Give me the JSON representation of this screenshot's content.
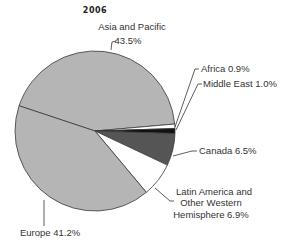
{
  "chart_data": {
    "type": "pie",
    "title": "2006",
    "categories": [
      "Asia and Pacific",
      "Africa",
      "Middle East",
      "Canada",
      "Latin America and Other Western Hemisphere",
      "Europe"
    ],
    "values": [
      43.5,
      0.9,
      1.0,
      6.5,
      6.9,
      41.2
    ],
    "unit": "%",
    "colors": [
      "#b5b5b5",
      "#ffffff",
      "#111111",
      "#555555",
      "#ffffff",
      "#b5b5b5"
    ],
    "legend": "none (direct labels with leader lines)",
    "labels": [
      {
        "lines": [
          "Asia and Pacific",
          "43.5%"
        ]
      },
      {
        "lines": [
          "Africa 0.9%"
        ]
      },
      {
        "lines": [
          "Middle East 1.0%"
        ]
      },
      {
        "lines": [
          "Canada 6.5%"
        ]
      },
      {
        "lines": [
          "Latin America and",
          "Other Western",
          "Hemisphere 6.9%"
        ]
      },
      {
        "lines": [
          "Europe 41.2%"
        ]
      }
    ]
  }
}
